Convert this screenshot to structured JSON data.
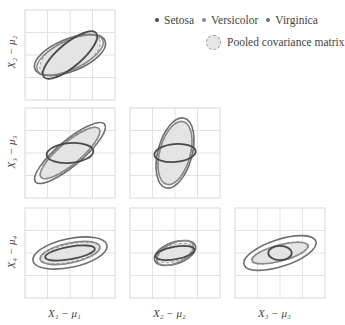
{
  "chart_data": {
    "type": "pairwise-covariance-ellipses",
    "title": "",
    "legend": {
      "entries": [
        {
          "name": "Setosa",
          "color": "#444444",
          "marker": "dot"
        },
        {
          "name": "Versicolor",
          "color": "#808080",
          "marker": "dot"
        },
        {
          "name": "Virginica",
          "color": "#6a6a6a",
          "marker": "dot"
        },
        {
          "name": "Pooled covariance matrix",
          "color": "#999999",
          "marker": "dashed-filled-circle"
        }
      ],
      "position": "top-right"
    },
    "grid": true,
    "grid_divisions": 4,
    "xlabels": [
      "X_1 − μ_1",
      "X_2 − μ_2",
      "X_3 − μ_3"
    ],
    "ylabels": [
      "X_2 − μ_2",
      "X_3 − μ_3",
      "X_4 − μ_4"
    ],
    "panels": [
      {
        "row": 0,
        "col": 0,
        "x": "X1",
        "y": "X2",
        "ellipses": {
          "Setosa": {
            "rx": 0.38,
            "ry": 0.13,
            "angle": -40
          },
          "Versicolor": {
            "rx": 0.4,
            "ry": 0.16,
            "angle": -25
          },
          "Virginica": {
            "rx": 0.42,
            "ry": 0.18,
            "angle": -22
          },
          "Pooled": {
            "rx": 0.37,
            "ry": 0.17,
            "angle": -28
          }
        }
      },
      {
        "row": 1,
        "col": 0,
        "x": "X1",
        "y": "X3",
        "ellipses": {
          "Setosa": {
            "rx": 0.26,
            "ry": 0.11,
            "angle": -5
          },
          "Versicolor": {
            "rx": 0.42,
            "ry": 0.12,
            "angle": -40
          },
          "Virginica": {
            "rx": 0.5,
            "ry": 0.14,
            "angle": -40
          },
          "Pooled": {
            "rx": 0.42,
            "ry": 0.13,
            "angle": -40
          }
        }
      },
      {
        "row": 1,
        "col": 1,
        "x": "X2",
        "y": "X3",
        "ellipses": {
          "Setosa": {
            "rx": 0.23,
            "ry": 0.1,
            "angle": -5
          },
          "Versicolor": {
            "rx": 0.36,
            "ry": 0.17,
            "angle": -75
          },
          "Virginica": {
            "rx": 0.4,
            "ry": 0.19,
            "angle": -75
          },
          "Pooled": {
            "rx": 0.36,
            "ry": 0.17,
            "angle": -75
          }
        }
      },
      {
        "row": 2,
        "col": 0,
        "x": "X1",
        "y": "X4",
        "ellipses": {
          "Setosa": {
            "rx": 0.28,
            "ry": 0.07,
            "angle": -10
          },
          "Versicolor": {
            "rx": 0.34,
            "ry": 0.11,
            "angle": -12
          },
          "Virginica": {
            "rx": 0.42,
            "ry": 0.16,
            "angle": -12
          },
          "Pooled": {
            "rx": 0.33,
            "ry": 0.1,
            "angle": -12
          }
        }
      },
      {
        "row": 2,
        "col": 1,
        "x": "X2",
        "y": "X4",
        "ellipses": {
          "Setosa": {
            "rx": 0.22,
            "ry": 0.07,
            "angle": -10
          },
          "Versicolor": {
            "rx": 0.22,
            "ry": 0.11,
            "angle": -25
          },
          "Virginica": {
            "rx": 0.24,
            "ry": 0.12,
            "angle": -20
          },
          "Pooled": {
            "rx": 0.2,
            "ry": 0.09,
            "angle": -20
          }
        }
      },
      {
        "row": 2,
        "col": 2,
        "x": "X3",
        "y": "X4",
        "ellipses": {
          "Setosa": {
            "rx": 0.13,
            "ry": 0.08,
            "angle": 0
          },
          "Versicolor": {
            "rx": 0.32,
            "ry": 0.09,
            "angle": -15
          },
          "Virginica": {
            "rx": 0.42,
            "ry": 0.15,
            "angle": -18
          },
          "Pooled": {
            "rx": 0.33,
            "ry": 0.09,
            "angle": -15
          }
        }
      }
    ]
  },
  "layout": {
    "cols_x": [
      25,
      130,
      235
    ],
    "rows_y": [
      10,
      108,
      208
    ],
    "panel_w": 90,
    "panel_h": 90
  },
  "colors": {
    "Setosa": "#4a4a4a",
    "Versicolor": "#8a8a8a",
    "Virginica": "#6e6e6e",
    "Pooled_stroke": "#9a9a9a",
    "Pooled_fill": "#e4e4e4",
    "grid": "#e2e2e2",
    "frame": "#d8d8d8"
  },
  "labels": {
    "legend_setosa": "Setosa",
    "legend_versicolor": "Versicolor",
    "legend_virginica": "Virginica",
    "legend_pooled": "Pooled covariance matrix",
    "x1": "X₁ − μ₁",
    "x2": "X₂ − μ₂",
    "x3": "X₃ − μ₃",
    "y2": "X₂ − μ₂",
    "y3": "X₃ − μ₃",
    "y4": "X₄ − μ₄"
  }
}
